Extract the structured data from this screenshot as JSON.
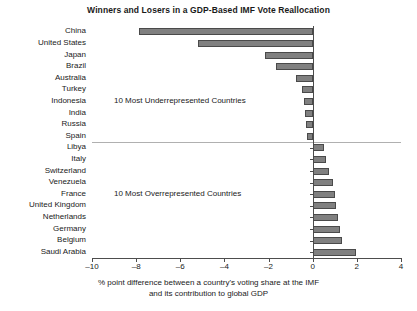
{
  "chart_data": {
    "type": "bar",
    "orientation": "horizontal",
    "title": "Winners and Losers in a GDP-Based IMF Vote Reallocation",
    "xlabel_line1": "% point difference between a country's voting share at the IMF",
    "xlabel_line2": "and its contribution to global GDP",
    "ylabel": "",
    "xlim": [
      -10,
      4
    ],
    "xticks": [
      -10,
      -8,
      -6,
      -4,
      -2,
      0,
      2,
      4
    ],
    "xtick_labels": [
      "–10",
      "–8",
      "–6",
      "–4",
      "–2",
      "0",
      "2",
      "4"
    ],
    "grid": false,
    "legend": null,
    "bar_color": "#808080",
    "bar_edge_color": "#4a4a4a",
    "axis_color": "#4d4d4d",
    "divider_color": "#b0b0b0",
    "categories": [
      "China",
      "United States",
      "Japan",
      "Brazil",
      "Australia",
      "Turkey",
      "Indonesia",
      "India",
      "Russia",
      "Spain",
      "Libya",
      "Italy",
      "Switzerland",
      "Venezuela",
      "France",
      "United Kingdom",
      "Netherlands",
      "Germany",
      "Belgium",
      "Saudi Arabia"
    ],
    "values": [
      -7.85,
      -5.2,
      -2.15,
      -1.65,
      -0.75,
      -0.5,
      -0.4,
      -0.35,
      -0.3,
      -0.25,
      0.5,
      0.6,
      0.75,
      0.9,
      1.0,
      1.05,
      1.15,
      1.25,
      1.35,
      1.95
    ],
    "annotations": [
      {
        "text": "10 Most Underrepresented Countries",
        "row_index": 6
      },
      {
        "text": "10 Most Overrepresented Countries",
        "row_index": 14
      }
    ],
    "group_divider_after_index": 9
  }
}
